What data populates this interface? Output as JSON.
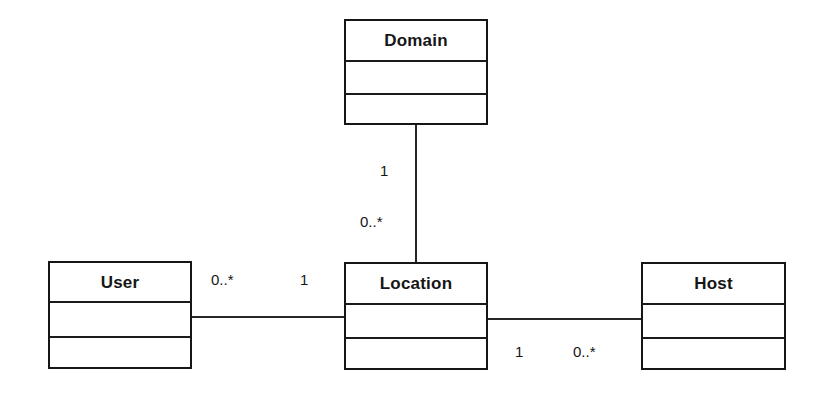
{
  "diagram": {
    "type": "uml-class-diagram",
    "width": 819,
    "height": 393,
    "background_color": "#ffffff",
    "line_color": "#262626",
    "text_color": "#161616",
    "classes": [
      {
        "id": "domain",
        "name": "Domain",
        "x": 344,
        "y": 19,
        "width": 144,
        "height": 106,
        "compartments": [
          41,
          33,
          32
        ]
      },
      {
        "id": "user",
        "name": "User",
        "x": 48,
        "y": 261,
        "width": 144,
        "height": 108,
        "compartments": [
          40,
          35,
          33
        ]
      },
      {
        "id": "location",
        "name": "Location",
        "x": 344,
        "y": 262,
        "width": 144,
        "height": 108,
        "compartments": [
          41,
          34,
          33
        ]
      },
      {
        "id": "host",
        "name": "Host",
        "x": 641,
        "y": 262,
        "width": 145,
        "height": 108,
        "compartments": [
          41,
          34,
          33
        ]
      }
    ],
    "associations": [
      {
        "id": "domain-location",
        "from": "domain",
        "to": "location",
        "orientation": "vertical",
        "x": 415,
        "y1": 125,
        "y2": 262,
        "from_multiplicity": "1",
        "to_multiplicity": "0..*"
      },
      {
        "id": "user-location",
        "from": "user",
        "to": "location",
        "orientation": "horizontal",
        "y": 316,
        "x1": 192,
        "x2": 344,
        "from_multiplicity": "0..*",
        "to_multiplicity": "1"
      },
      {
        "id": "location-host",
        "from": "location",
        "to": "host",
        "orientation": "horizontal",
        "y": 318,
        "x1": 488,
        "x2": 641,
        "from_multiplicity": "1",
        "to_multiplicity": "0..*"
      }
    ],
    "multiplicity_labels": [
      {
        "id": "domain-end",
        "text": "1",
        "x": 380,
        "y": 163
      },
      {
        "id": "location-top-end",
        "text": "0..*",
        "x": 360,
        "y": 214
      },
      {
        "id": "user-end",
        "text": "0..*",
        "x": 211,
        "y": 272
      },
      {
        "id": "location-left-end",
        "text": "1",
        "x": 300,
        "y": 272
      },
      {
        "id": "location-right-end",
        "text": "1",
        "x": 515,
        "y": 344
      },
      {
        "id": "host-end",
        "text": "0..*",
        "x": 573,
        "y": 344
      }
    ]
  }
}
